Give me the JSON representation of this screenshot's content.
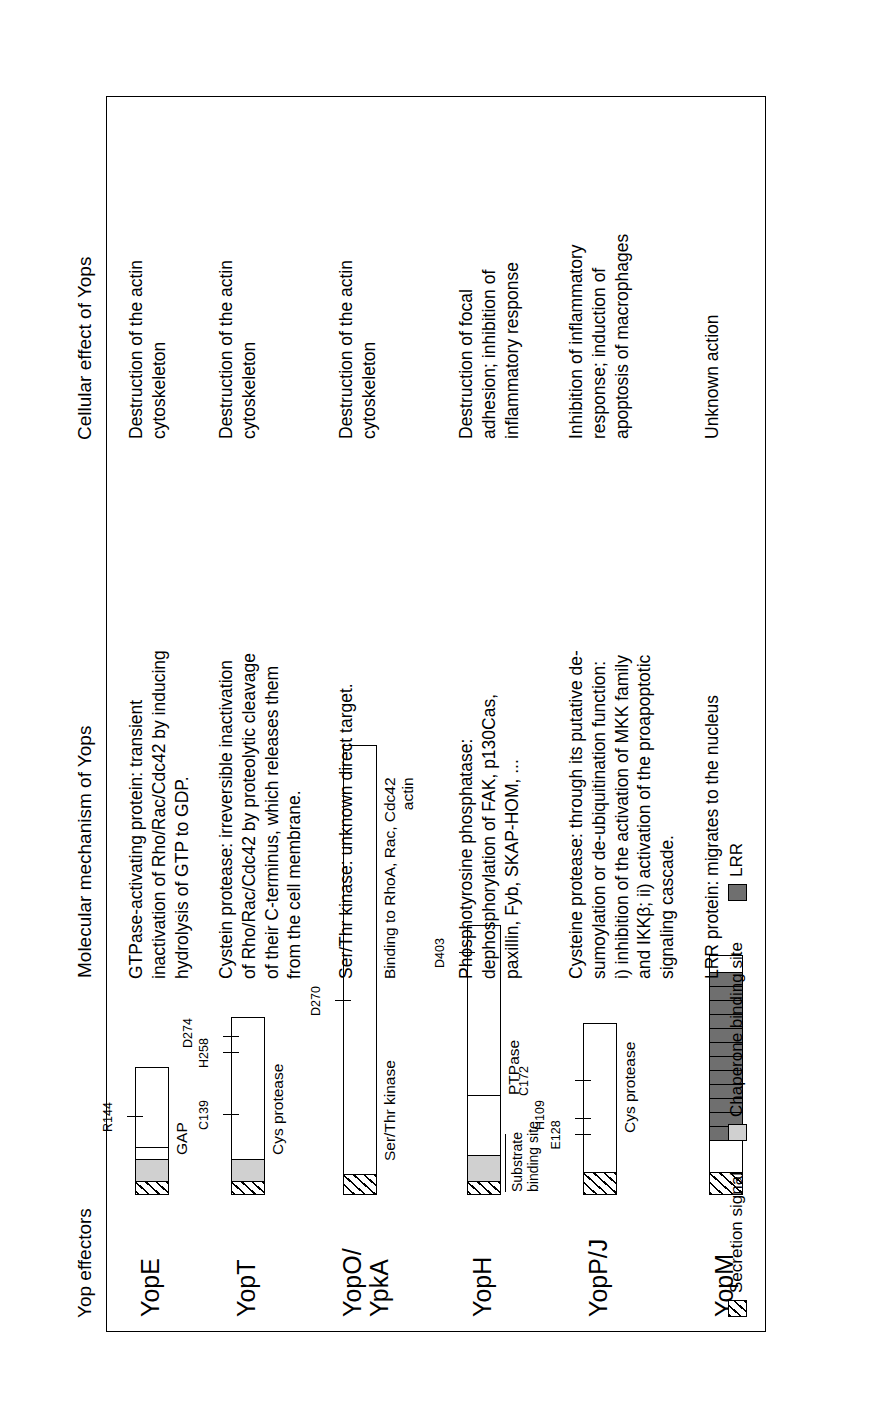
{
  "figure": {
    "orientation": "rotated-90-ccw",
    "headers": {
      "yop_effectors": "Yop effectors",
      "molecular_mechanism": "Molecular mechanism of Yops",
      "cellular_effect": "Cellular effect of Yops"
    }
  },
  "rows": [
    {
      "name": "YopE",
      "mechanism": "GTPase-activating protein: transient inactivation of Rho/Rac/Cdc42 by inducing hydrolysis of GTP to GDP.",
      "effect": "Destruction of the actin cytoskeleton",
      "domain_caption": "GAP",
      "residues": [
        "R144"
      ]
    },
    {
      "name": "YopT",
      "mechanism": "Cystein protease: irreversible inactivation of Rho/Rac/Cdc42 by proteolytic cleavage of their C-terminus, which releases them from the cell membrane.",
      "effect": "Destruction of the actin cytoskeleton",
      "domain_caption": "Cys protease",
      "residues": [
        "C139",
        "H258",
        "D274"
      ]
    },
    {
      "name": "YopO/\nYpkA",
      "mechanism": "Ser/Thr kinase: unknown direct target.",
      "effect": "Destruction of the actin cytoskeleton",
      "domain_caption": "Ser/Thr kinase",
      "domain_caption2": "Binding to RhoA, Rac, Cdc42\nactin",
      "residues": [
        "D270"
      ]
    },
    {
      "name": "YopH",
      "mechanism": "Phosphotyrosine phosphatase: dephosphorylation of FAK, p130Cas, paxillin, Fyb, SKAP-HOM, ...",
      "effect": "Destruction of focal adhesion; inhibition of inflammatory response",
      "domain_caption": "PTPase",
      "bracket_label": "Substrate\nbinding site",
      "residues": [
        "D403"
      ]
    },
    {
      "name": "YopP/J",
      "mechanism": "Cysteine protease: through its putative de-sumoylation or de-ubiquitination function: i) inhibition of the activation of MKK family and IKKβ; ii) activation of the proapoptotic signaling cascade.",
      "effect": "Inhibition of inflammatory response; induction of apoptosis of macrophages",
      "domain_caption": "Cys protease",
      "residues": [
        "E128",
        "H109",
        "C172"
      ]
    },
    {
      "name": "YopM",
      "mechanism": "LRR protein: migrates to the nucleus",
      "effect": "Unknown action",
      "domain_caption": "",
      "residues": []
    }
  ],
  "legend": {
    "items": [
      {
        "label": "Secretion signal",
        "swatch": "hatched-swatch"
      },
      {
        "label": "Chaperone binding site",
        "swatch": "light-gray-swatch"
      },
      {
        "label": "LRR",
        "swatch": "dark-gray-swatch"
      }
    ]
  },
  "colors": {
    "secretion_signal": "#ffffff",
    "chaperone_binding_site": "#d0d0d0",
    "lrr": "#6f6f6f",
    "outline": "#000000",
    "background": "#ffffff"
  }
}
